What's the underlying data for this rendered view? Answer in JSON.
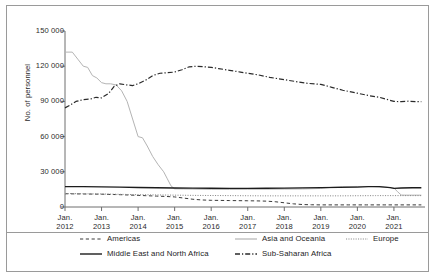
{
  "chart_data": {
    "type": "line",
    "title": "",
    "subtitle": "",
    "xlabel": "",
    "ylabel": "No. of personnel",
    "ylim": [
      0,
      150000
    ],
    "yticks": [
      0,
      30000,
      60000,
      90000,
      120000,
      150000
    ],
    "ytick_labels": [
      "0",
      "30 000",
      "60 000",
      "90 000",
      "120 000",
      "150 000"
    ],
    "xticks": [
      2012,
      2013,
      2014,
      2015,
      2016,
      2017,
      2018,
      2019,
      2020,
      2021
    ],
    "xtick_labels": [
      {
        "month": "Jan.",
        "year": "2012"
      },
      {
        "month": "Jan.",
        "year": "2013"
      },
      {
        "month": "Jan.",
        "year": "2014"
      },
      {
        "month": "Jan.",
        "year": "2015"
      },
      {
        "month": "Jan.",
        "year": "2016"
      },
      {
        "month": "Jan.",
        "year": "2017"
      },
      {
        "month": "Jan.",
        "year": "2018"
      },
      {
        "month": "Jan.",
        "year": "2019"
      },
      {
        "month": "Jan.",
        "year": "2020"
      },
      {
        "month": "Jan.",
        "year": "2021"
      }
    ],
    "xlim": [
      2012.0,
      2021.85
    ],
    "grid": false,
    "legend_position": "bottom",
    "series": [
      {
        "name": "Americas",
        "style": "dashed",
        "color": "#3a3a3a",
        "width": 1.0,
        "x": [
          2012.0,
          2012.25,
          2012.5,
          2012.75,
          2013.0,
          2013.25,
          2013.5,
          2013.75,
          2014.0,
          2014.25,
          2014.5,
          2014.75,
          2015.0,
          2015.25,
          2015.5,
          2015.75,
          2016.0,
          2016.25,
          2016.5,
          2016.75,
          2017.0,
          2017.25,
          2017.5,
          2017.75,
          2018.0,
          2018.25,
          2018.5,
          2018.75,
          2019.0,
          2019.25,
          2019.5,
          2019.75,
          2020.0,
          2020.25,
          2020.5,
          2020.75,
          2021.0,
          2021.25,
          2021.5,
          2021.75
        ],
        "y": [
          11300,
          11200,
          11100,
          11000,
          10900,
          10700,
          10500,
          10200,
          9900,
          9600,
          9300,
          9000,
          8600,
          7600,
          6600,
          6000,
          5700,
          5600,
          5500,
          5400,
          5300,
          5200,
          5000,
          4500,
          3600,
          2700,
          2100,
          1900,
          1800,
          1800,
          1800,
          1800,
          1800,
          1800,
          1800,
          1800,
          1800,
          1800,
          1800,
          1800
        ]
      },
      {
        "name": "Asia and Oceania",
        "style": "solid",
        "color": "#b4b4b4",
        "width": 1.0,
        "x": [
          2012.0,
          2012.2,
          2012.35,
          2012.5,
          2012.62,
          2012.75,
          2012.87,
          2013.0,
          2013.12,
          2013.25,
          2013.4,
          2013.55,
          2013.7,
          2013.85,
          2014.0,
          2014.12,
          2014.25,
          2014.4,
          2014.55,
          2014.7,
          2014.8,
          2014.9,
          2015.0,
          2015.25,
          2015.5,
          2015.75,
          2016.0,
          2016.5,
          2017.0,
          2017.5,
          2018.0,
          2018.5,
          2019.0,
          2019.3,
          2019.6,
          2020.0,
          2020.4,
          2020.8,
          2021.0,
          2021.1,
          2021.2,
          2021.3,
          2021.5,
          2021.75
        ],
        "y": [
          132000,
          132000,
          126000,
          120000,
          119000,
          112000,
          110000,
          106000,
          105000,
          105000,
          104000,
          99000,
          90000,
          75000,
          60000,
          59000,
          52000,
          43000,
          36000,
          30000,
          24000,
          18000,
          15500,
          15400,
          15300,
          15200,
          15100,
          15000,
          15100,
          15200,
          15300,
          15400,
          15800,
          16800,
          17400,
          17500,
          17500,
          16800,
          16200,
          13000,
          10200,
          10100,
          10100,
          10100
        ]
      },
      {
        "name": "Europe",
        "style": "dotted",
        "color": "#8c8c8c",
        "width": 1.0,
        "x": [
          2012.0,
          2012.5,
          2013.0,
          2013.5,
          2014.0,
          2014.5,
          2015.0,
          2015.5,
          2016.0,
          2016.5,
          2017.0,
          2017.5,
          2018.0,
          2018.5,
          2019.0,
          2019.5,
          2020.0,
          2020.5,
          2021.0,
          2021.5,
          2021.75
        ],
        "y": [
          11500,
          11300,
          11100,
          10800,
          10500,
          10300,
          10100,
          9900,
          9800,
          9700,
          9600,
          9500,
          9500,
          9500,
          9500,
          9500,
          9600,
          9700,
          9700,
          9700,
          9700
        ]
      },
      {
        "name": "Middle East and North Africa",
        "style": "solid",
        "color": "#1c1c1c",
        "width": 1.3,
        "x": [
          2012.0,
          2012.5,
          2013.0,
          2013.5,
          2014.0,
          2014.5,
          2015.0,
          2015.5,
          2016.0,
          2016.5,
          2017.0,
          2017.5,
          2018.0,
          2018.5,
          2019.0,
          2019.5,
          2020.0,
          2020.3,
          2020.6,
          2020.9,
          2021.0,
          2021.2,
          2021.5,
          2021.75
        ],
        "y": [
          17400,
          17300,
          17200,
          17000,
          16600,
          16400,
          16200,
          16100,
          16000,
          15900,
          15900,
          16000,
          16100,
          16300,
          16500,
          16700,
          17000,
          17300,
          17400,
          16500,
          15900,
          16200,
          16400,
          16400
        ]
      },
      {
        "name": "Sub-Saharan Africa",
        "style": "dashdot",
        "color": "#2a2a2a",
        "width": 1.2,
        "x": [
          2012.0,
          2012.15,
          2012.3,
          2012.5,
          2012.7,
          2012.85,
          2013.0,
          2013.2,
          2013.35,
          2013.5,
          2013.7,
          2013.85,
          2014.0,
          2014.2,
          2014.4,
          2014.6,
          2014.8,
          2015.0,
          2015.2,
          2015.4,
          2015.6,
          2015.8,
          2016.0,
          2016.2,
          2016.5,
          2016.8,
          2017.0,
          2017.3,
          2017.6,
          2018.0,
          2018.3,
          2018.6,
          2019.0,
          2019.3,
          2019.6,
          2020.0,
          2020.3,
          2020.6,
          2021.0,
          2021.2,
          2021.4,
          2021.6,
          2021.75
        ],
        "y": [
          84500,
          87000,
          90000,
          91500,
          92000,
          93500,
          93000,
          97000,
          103000,
          105000,
          104000,
          103500,
          105000,
          108000,
          112000,
          114000,
          114500,
          115000,
          117000,
          119500,
          120000,
          119500,
          119000,
          118000,
          116500,
          115000,
          114000,
          112500,
          110500,
          108500,
          107000,
          105500,
          104500,
          102000,
          99500,
          97000,
          95000,
          93500,
          90000,
          89800,
          90200,
          89800,
          89800
        ]
      }
    ]
  },
  "legend": {
    "items": [
      {
        "label": "Americas",
        "style": "dashed"
      },
      {
        "label": "Asia and Oceania",
        "style": "solid-light"
      },
      {
        "label": "Europe",
        "style": "dotted"
      },
      {
        "label": "Middle East and North Africa",
        "style": "solid-dark"
      },
      {
        "label": "Sub-Saharan Africa",
        "style": "dashdot"
      }
    ]
  },
  "axes": {
    "y_title": "No. of personnel"
  },
  "colors": {
    "frame": "#9a9a9a",
    "axis": "#6e6e6e",
    "text": "#2b2b2b"
  }
}
